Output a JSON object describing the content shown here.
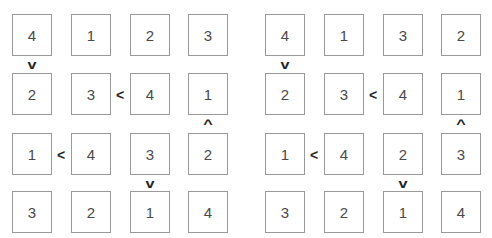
{
  "puzzle": {
    "grids": [
      {
        "name": "left-grid",
        "rows": [
          [
            "4",
            "1",
            "2",
            "3"
          ],
          [
            "2",
            "3",
            "4",
            "1"
          ],
          [
            "1",
            "4",
            "3",
            "2"
          ],
          [
            "3",
            "2",
            "1",
            "4"
          ]
        ],
        "constraints": [
          {
            "symbol": "v",
            "kind": "greater-than-down",
            "row": 1,
            "col": 1
          },
          {
            "symbol": "<",
            "kind": "less-than-right",
            "row": 2,
            "col": 2
          },
          {
            "symbol": "^",
            "kind": "greater-than-up",
            "row": 3,
            "col": 4
          },
          {
            "symbol": "<",
            "kind": "less-than-right",
            "row": 3,
            "col": 1
          },
          {
            "symbol": "v",
            "kind": "greater-than-down",
            "row": 3,
            "col": 3
          }
        ]
      },
      {
        "name": "right-grid",
        "rows": [
          [
            "4",
            "1",
            "3",
            "2"
          ],
          [
            "2",
            "3",
            "4",
            "1"
          ],
          [
            "1",
            "4",
            "2",
            "3"
          ],
          [
            "3",
            "2",
            "1",
            "4"
          ]
        ],
        "constraints": [
          {
            "symbol": "v",
            "kind": "greater-than-down",
            "row": 1,
            "col": 1
          },
          {
            "symbol": "<",
            "kind": "less-than-right",
            "row": 2,
            "col": 2
          },
          {
            "symbol": "^",
            "kind": "greater-than-up",
            "row": 3,
            "col": 4
          },
          {
            "symbol": "<",
            "kind": "less-than-right",
            "row": 3,
            "col": 1
          },
          {
            "symbol": "v",
            "kind": "greater-than-down",
            "row": 3,
            "col": 3
          }
        ]
      }
    ],
    "colors": {
      "cell_border": "#9a9a9a",
      "digit": "#4a4a4a",
      "constraint": "#262626",
      "background": "#ffffff"
    }
  }
}
